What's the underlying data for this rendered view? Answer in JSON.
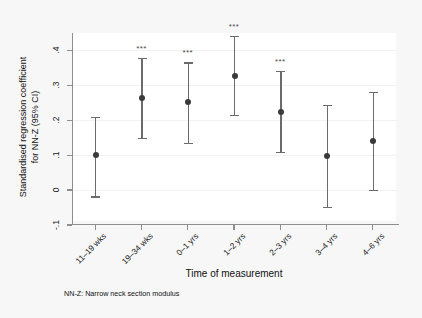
{
  "chart_data": {
    "type": "scatter",
    "title": "",
    "xlabel": "Time of measurement",
    "ylabel": "Standardised regression coefficient for NN-Z (95% CI)",
    "ylabel_line1": "Standardised regression coefficient",
    "ylabel_line2": "for NN-Z (95% CI)",
    "footnote": "NN-Z: Narrow neck section modulus",
    "ylim": [
      -0.1,
      0.45
    ],
    "ytick_values": [
      -0.1,
      0,
      0.1,
      0.2,
      0.3,
      0.4
    ],
    "ytick_labels": [
      "-.1",
      "0",
      ".1",
      ".2",
      ".3",
      ".4"
    ],
    "grid": true,
    "legend": "none",
    "categories": [
      "11–19 wks",
      "19–34 wks",
      "0–1 yrs",
      "1–2 yrs",
      "2–3 yrs",
      "3–4 yrs",
      "4–6 yrs"
    ],
    "values": [
      0.1,
      0.265,
      0.252,
      0.328,
      0.224,
      0.098,
      0.141
    ],
    "ci_lower": [
      -0.018,
      0.15,
      0.136,
      0.215,
      0.109,
      -0.048,
      0.0
    ],
    "ci_upper": [
      0.209,
      0.378,
      0.366,
      0.442,
      0.341,
      0.244,
      0.282
    ],
    "significance": [
      "",
      "***",
      "***",
      "***",
      "***",
      "",
      ""
    ],
    "significance_label": "***",
    "marker_color": "#3a3a3a",
    "ci_color": "#6b6b6b",
    "axis_color": "#8e8e8e",
    "background_color": "#f7f7f7",
    "plot_background_color": "#ffffff"
  }
}
